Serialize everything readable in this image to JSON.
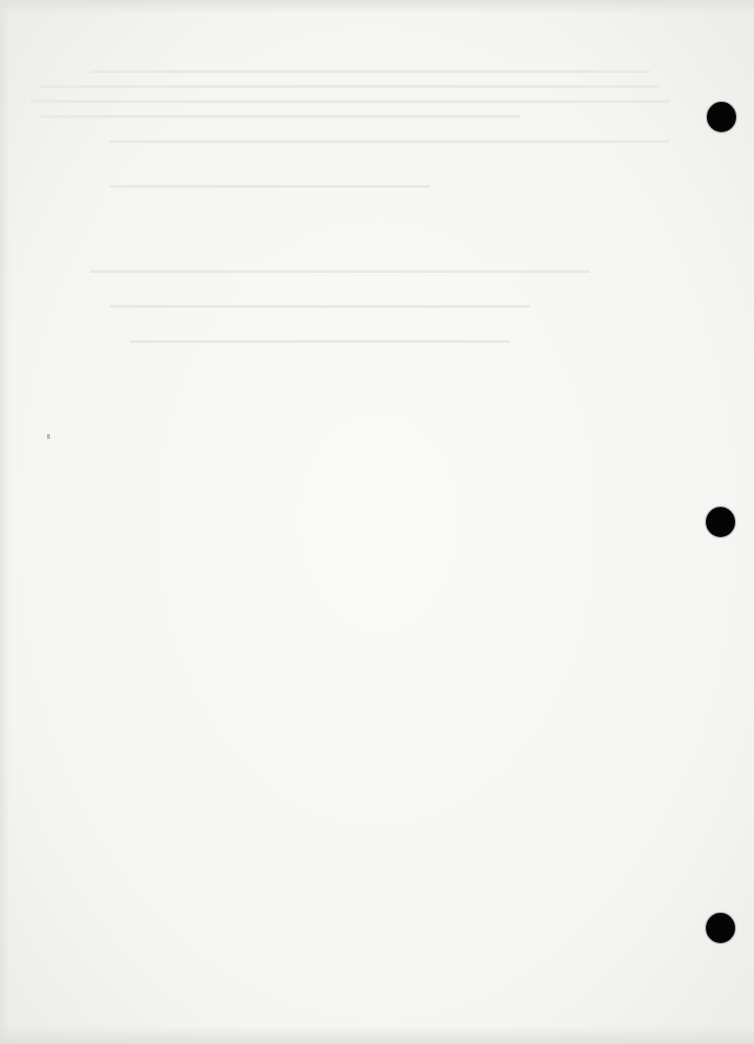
{
  "document": {
    "type": "scanned-blank-page",
    "text": "",
    "paper_color": "#f5f5f3",
    "hole_color": "#050505",
    "punch_holes": [
      {
        "x": 721,
        "y": 117
      },
      {
        "x": 720,
        "y": 522
      },
      {
        "x": 720,
        "y": 928
      }
    ],
    "bleed_through_lines": [
      {
        "x": 90,
        "y": 70,
        "w": 560
      },
      {
        "x": 40,
        "y": 85,
        "w": 620
      },
      {
        "x": 30,
        "y": 100,
        "w": 640
      },
      {
        "x": 40,
        "y": 115,
        "w": 480
      },
      {
        "x": 110,
        "y": 140,
        "w": 560
      },
      {
        "x": 110,
        "y": 185,
        "w": 320
      },
      {
        "x": 90,
        "y": 270,
        "w": 500
      },
      {
        "x": 110,
        "y": 305,
        "w": 420
      },
      {
        "x": 130,
        "y": 340,
        "w": 380
      }
    ]
  }
}
